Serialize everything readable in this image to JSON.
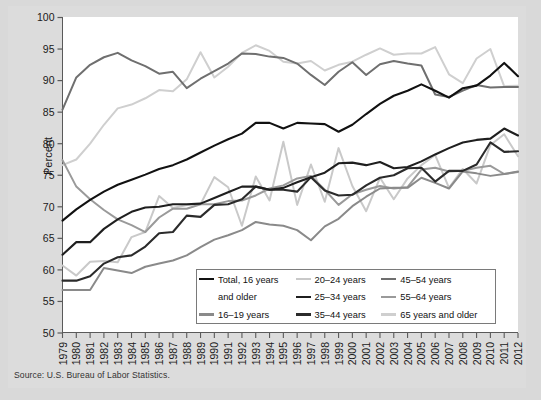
{
  "figure": {
    "ylabel": "Percent",
    "source": "Source: U.S. Bureau of Labor Statistics."
  },
  "legend": {
    "rows": [
      [
        {
          "label": "Total, 16 years",
          "color": "#111111",
          "swatch": true
        },
        {
          "label": "20–24 years",
          "color": "#c9c9c9",
          "swatch": true
        },
        {
          "label": "45–54 years",
          "color": "#6f6f6f",
          "swatch": true
        }
      ],
      [
        {
          "label": "and older",
          "color": "#111111",
          "swatch": false
        },
        {
          "label": "25–34 years",
          "color": "#1f1f1f",
          "swatch": true
        },
        {
          "label": "55–64 years",
          "color": "#9a9a9a",
          "swatch": true
        }
      ],
      [
        {
          "label": "16–19 years",
          "color": "#8a8a8a",
          "swatch": true
        },
        {
          "label": "35–44 years",
          "color": "#2b2b2b",
          "swatch": true
        },
        {
          "label": "65 years and older",
          "color": "#cfcfcf",
          "swatch": true
        }
      ]
    ]
  },
  "chart_data": {
    "type": "line",
    "title": "",
    "xlabel": "",
    "ylabel": "Percent",
    "ylim": [
      50,
      100
    ],
    "ytick_step": 5,
    "yticks": [
      50,
      55,
      60,
      65,
      70,
      75,
      80,
      85,
      90,
      95,
      100
    ],
    "grid": false,
    "legend_position": "inside-bottom-center",
    "x": [
      1979,
      1980,
      1981,
      1982,
      1983,
      1984,
      1985,
      1986,
      1987,
      1988,
      1989,
      1990,
      1991,
      1992,
      1993,
      1994,
      1995,
      1996,
      1997,
      1998,
      1999,
      2000,
      2001,
      2002,
      2003,
      2004,
      2005,
      2006,
      2007,
      2008,
      2009,
      2010,
      2011,
      2012
    ],
    "series": [
      {
        "name": "Total, 16 years and older",
        "color": "#111111",
        "width": 2.1,
        "values": [
          67.8,
          69.6,
          71.1,
          72.4,
          73.5,
          74.3,
          75.1,
          76.0,
          76.6,
          77.5,
          78.6,
          79.7,
          80.7,
          81.6,
          83.3,
          83.3,
          82.4,
          83.3,
          83.2,
          83.1,
          81.9,
          83.0,
          84.7,
          86.3,
          87.6,
          88.4,
          89.4,
          88.4,
          87.3,
          88.8,
          89.2,
          90.8,
          92.8,
          90.7
        ]
      },
      {
        "name": "16–19 years",
        "color": "#8a8a8a",
        "width": 2.0,
        "values": [
          56.8,
          56.8,
          56.8,
          60.3,
          59.9,
          59.5,
          60.5,
          61.0,
          61.5,
          62.3,
          63.6,
          64.8,
          65.5,
          66.3,
          67.6,
          67.2,
          67.0,
          66.3,
          64.7,
          66.9,
          68.1,
          70.1,
          71.6,
          72.9,
          73.0,
          73.0,
          74.6,
          73.8,
          72.9,
          75.6,
          75.3,
          74.9,
          75.2,
          75.6
        ]
      },
      {
        "name": "20–24 years",
        "color": "#c9c9c9",
        "width": 2.0,
        "values": [
          60.7,
          59.1,
          61.3,
          61.4,
          61.2,
          65.2,
          66.0,
          71.7,
          69.8,
          70.3,
          70.4,
          74.7,
          73.1,
          67.0,
          74.8,
          71.0,
          80.3,
          70.3,
          76.7,
          70.8,
          79.3,
          73.3,
          69.3,
          74.6,
          71.2,
          74.5,
          76.6,
          78.2,
          73.0,
          76.0,
          73.7,
          79.8,
          81.5,
          78.0
        ]
      },
      {
        "name": "25–34 years",
        "color": "#1f1f1f",
        "width": 2.1,
        "values": [
          62.4,
          64.4,
          64.4,
          66.5,
          68.0,
          69.2,
          69.9,
          70.0,
          70.4,
          70.4,
          70.5,
          71.4,
          72.3,
          73.2,
          73.2,
          72.7,
          73.0,
          73.9,
          74.7,
          75.4,
          76.9,
          77.0,
          76.6,
          77.1,
          76.1,
          76.3,
          77.2,
          78.3,
          79.3,
          80.2,
          80.6,
          80.8,
          82.4,
          81.3
        ]
      },
      {
        "name": "35–44 years",
        "color": "#2b2b2b",
        "width": 2.1,
        "values": [
          58.3,
          58.3,
          59.0,
          61.0,
          62.0,
          62.3,
          63.7,
          65.8,
          66.0,
          68.6,
          68.4,
          70.3,
          70.4,
          71.2,
          73.2,
          72.7,
          72.7,
          72.4,
          74.7,
          72.6,
          71.8,
          71.9,
          73.4,
          74.6,
          75.0,
          76.1,
          76.2,
          74.0,
          75.7,
          75.7,
          76.7,
          80.2,
          78.7,
          78.8
        ]
      },
      {
        "name": "45–54 years",
        "color": "#6f6f6f",
        "width": 2.0,
        "values": [
          85.4,
          90.5,
          92.5,
          93.7,
          94.4,
          93.2,
          92.3,
          91.1,
          91.4,
          88.8,
          90.3,
          91.5,
          92.7,
          94.3,
          94.2,
          93.8,
          93.6,
          92.7,
          90.9,
          89.3,
          91.4,
          92.9,
          90.9,
          92.6,
          93.1,
          92.7,
          92.4,
          87.8,
          87.4,
          88.4,
          89.3,
          88.9,
          89.0,
          89.0
        ]
      },
      {
        "name": "55–64 years",
        "color": "#9a9a9a",
        "width": 2.0,
        "values": [
          77.4,
          73.2,
          71.2,
          69.5,
          68.0,
          67.1,
          66.0,
          68.3,
          69.7,
          69.7,
          70.4,
          70.4,
          70.9,
          71.0,
          71.8,
          72.9,
          73.4,
          74.5,
          74.9,
          72.7,
          70.3,
          72.0,
          72.7,
          73.3,
          72.9,
          73.1,
          75.9,
          76.2,
          75.6,
          75.7,
          76.2,
          76.5,
          75.2,
          75.5
        ]
      },
      {
        "name": "65 years and older",
        "color": "#cfcfcf",
        "width": 2.0,
        "values": [
          76.6,
          77.5,
          80.0,
          83.0,
          85.6,
          86.2,
          87.2,
          88.5,
          88.3,
          90.2,
          94.5,
          90.5,
          92.2,
          94.4,
          95.6,
          94.7,
          93.0,
          92.7,
          93.1,
          91.6,
          92.5,
          93.0,
          94.1,
          95.1,
          94.1,
          94.3,
          94.3,
          95.3,
          91.0,
          89.6,
          93.5,
          95.0,
          89.1,
          89.2
        ]
      }
    ]
  }
}
